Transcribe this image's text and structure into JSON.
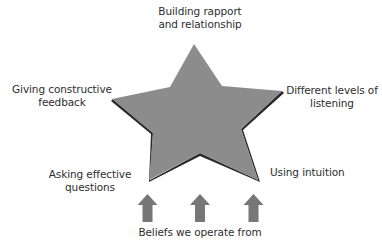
{
  "diagram": {
    "type": "star-framework",
    "colors": {
      "star_fill": "#8c8c8c",
      "star_shadow": "#2a2a2a",
      "arrow_fill": "#777777",
      "text": "#2e2e2e",
      "background": "#ffffff"
    },
    "star_points": {
      "top": {
        "line1": "Building rapport",
        "line2": "and relationship"
      },
      "left": {
        "line1": "Giving constructive",
        "line2": "feedback"
      },
      "right": {
        "line1": "Different levels of",
        "line2": "listening"
      },
      "bottom_left": {
        "line1": "Asking effective",
        "line2": "questions"
      },
      "bottom_right": {
        "line1": "Using intuition"
      }
    },
    "foundation": {
      "label": "Beliefs we operate from",
      "arrow_count": 3,
      "arrow_icon": "up-arrow-icon"
    }
  }
}
